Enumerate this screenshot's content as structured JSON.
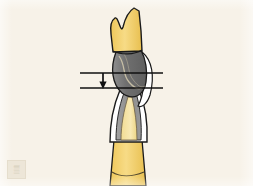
{
  "figure": {
    "caption": "",
    "background_color": "#f7f2e8",
    "outline_color": "#1a1a1a",
    "annotation": {
      "arrow_label": "",
      "arrow_direction": "down",
      "reference_line_count": 2,
      "reference_line_color": "#111111"
    },
    "parts": [
      {
        "id": "upper-crown-gold",
        "label": "gold crown (upper restoration)",
        "color": "#f2cf63"
      },
      {
        "id": "upper-post-metal",
        "label": "metal core / amalgam build-up",
        "color": "#7b7b7b"
      },
      {
        "id": "upper-margin-highlight",
        "label": "crown margin highlight",
        "color": "#ffffff"
      },
      {
        "id": "lower-enamel",
        "label": "enamel (outer layer)",
        "color": "#ffffff"
      },
      {
        "id": "lower-dentin",
        "label": "dentin (middle layer)",
        "color": "#8c8c8c"
      },
      {
        "id": "lower-pulp",
        "label": "pulp chamber",
        "color": "#f5e3a3"
      },
      {
        "id": "lower-root-gold",
        "label": "gold root restoration",
        "color": "#f2cf63"
      }
    ]
  },
  "watermark": {
    "glyph": "▒",
    "name": "image-watermark"
  }
}
